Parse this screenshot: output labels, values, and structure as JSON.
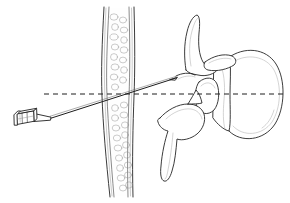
{
  "figure": {
    "title": "Lateral spinal needle placement diagram",
    "kind": "line-art anatomical illustration",
    "background_color": "#ffffff",
    "width": 290,
    "height": 203,
    "stroke_color": "#262626",
    "shade_color": "#a8a8a8",
    "guide_color": "#1e1e1e"
  },
  "labels": {
    "syringe_hub": "needle hub",
    "needle_shaft": "spinal needle shaft",
    "needle_tip": "needle tip",
    "trajectory_guide": "horizontal trajectory reference line",
    "tissue_column": "textured vertical tissue column",
    "vertebral_body": "vertebral body",
    "vertebral_foramen": "vertebral foramen",
    "superior_articular_process": "superior articular process",
    "transverse_process": "transverse process",
    "inferior_articular_process": "inferior articular process",
    "pedicle": "pedicle"
  },
  "geometry": {
    "needle_entry": [
      50,
      118
    ],
    "needle_tip": [
      176,
      78
    ],
    "guide_line_y": 94,
    "guide_line_x_start": 44,
    "guide_line_x_end": 286,
    "tissue_column_x": [
      100,
      141
    ],
    "vertebral_body_center": [
      247,
      94
    ]
  }
}
